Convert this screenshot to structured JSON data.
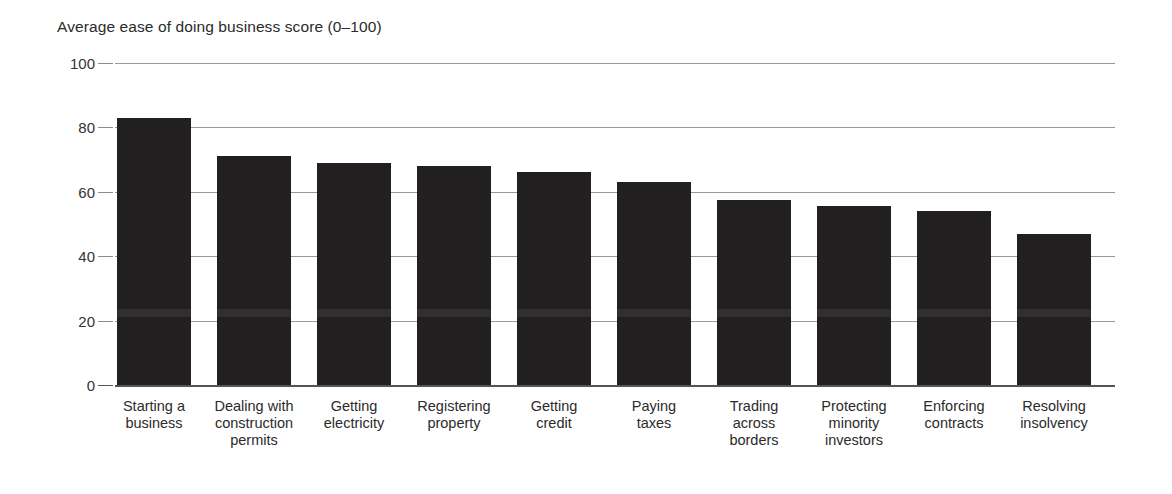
{
  "chart_data": {
    "type": "bar",
    "title": "Average ease of doing business score (0–100)",
    "xlabel": "",
    "ylabel": "",
    "ylim": [
      0,
      100
    ],
    "ytick_labels": [
      "0",
      "20",
      "40",
      "60",
      "80",
      "100"
    ],
    "yticks": [
      0,
      20,
      40,
      60,
      80,
      100
    ],
    "grid": true,
    "legend": false,
    "bar_color": "#211f1f",
    "categories": [
      "Starting a business",
      "Dealing with construction permits",
      "Getting electricity",
      "Registering property",
      "Getting credit",
      "Paying taxes",
      "Trading across borders",
      "Protecting minority investors",
      "Enforcing contracts",
      "Resolving insolvency"
    ],
    "category_lines": [
      [
        "Starting a",
        "business"
      ],
      [
        "Dealing with",
        "construction",
        "permits"
      ],
      [
        "Getting",
        "electricity"
      ],
      [
        "Registering",
        "property"
      ],
      [
        "Getting",
        "credit"
      ],
      [
        "Paying",
        "taxes"
      ],
      [
        "Trading",
        "across",
        "borders"
      ],
      [
        "Protecting",
        "minority",
        "investors"
      ],
      [
        "Enforcing",
        "contracts"
      ],
      [
        "Resolving",
        "insolvency"
      ]
    ],
    "values": [
      83,
      71,
      69,
      68,
      66,
      63,
      57.5,
      55.5,
      54,
      47
    ]
  }
}
